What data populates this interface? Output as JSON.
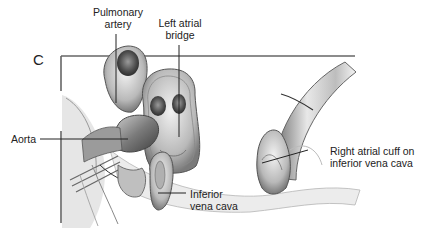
{
  "figure": {
    "panel_letter": "C",
    "labels": {
      "pulmonary_artery": [
        "Pulmonary",
        "artery"
      ],
      "left_atrial_bridge": [
        "Left atrial",
        "bridge"
      ],
      "aorta": [
        "Aorta"
      ],
      "inferior_vena_cava": [
        "Inferior",
        "vena cava"
      ],
      "right_atrial_cuff": [
        "Right atrial cuff on",
        "inferior vena cava"
      ]
    },
    "colors": {
      "line": "#555555",
      "tissue_light": "#d9d9d9",
      "tissue_mid": "#a8a8a8",
      "tissue_dark": "#5a5a5a",
      "background": "#ffffff"
    }
  }
}
